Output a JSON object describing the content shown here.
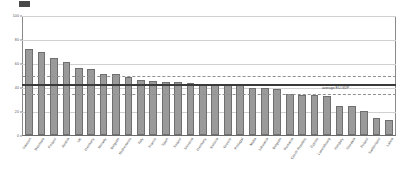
{
  "chart_data": {
    "type": "bar",
    "title": "",
    "subtitle": "",
    "xlabel": "",
    "ylabel": "",
    "ylim": [
      0,
      100
    ],
    "yticks": [
      0,
      20,
      40,
      60,
      80,
      100
    ],
    "ytick_labels": [
      "0",
      "20",
      "40",
      "60",
      "80",
      "100"
    ],
    "grid": true,
    "legend_position": "none",
    "categories": [
      "Sweden",
      "Denmark",
      "Finland",
      "Austria",
      "UK",
      "Germany",
      "Norway",
      "Belgium",
      "Netherlands",
      "Italy",
      "France",
      "Spain",
      "Ireland",
      "Slovenia",
      "Germany",
      "Estonia",
      "Greece",
      "Portugal",
      "Malta",
      "Lithuania",
      "Belgium",
      "Romania",
      "Czech Republic",
      "Cyprus",
      "Luxembourg",
      "Hungary",
      "Slovakia",
      "Poland",
      "Switzerland",
      "Latvia"
    ],
    "values": [
      73,
      70,
      65,
      62,
      57,
      56,
      52,
      52,
      49,
      47,
      46,
      45,
      45,
      44,
      43,
      43,
      43,
      42,
      40,
      40,
      39,
      35,
      34,
      34,
      33,
      25,
      25,
      20,
      14,
      13
    ],
    "annotations": [
      {
        "name": "average-eu-gdp-line",
        "label": "average EU-GDP",
        "value": 43,
        "style": "solid"
      },
      {
        "name": "upper-band-line",
        "label": "",
        "value": 50,
        "style": "dashed"
      },
      {
        "name": "lower-band-line",
        "label": "",
        "value": 35,
        "style": "dashed"
      }
    ]
  }
}
